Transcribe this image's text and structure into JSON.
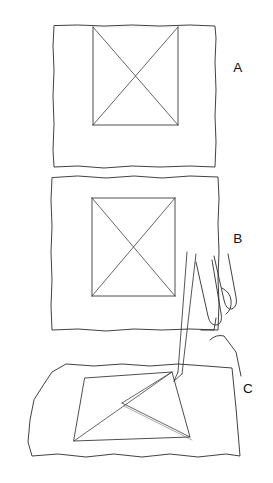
{
  "figure": {
    "background_color": "#ffffff",
    "ink_color": "#1a1a1a",
    "width": 273,
    "height": 483
  },
  "panels": [
    {
      "id": "panel-a",
      "label": "A",
      "label_x": 238,
      "label_y": 72,
      "description": "Flat sheet of paper, front view, containing an upright rectangle crossed by two full diagonals forming an X. The rectangle top edge is faint.",
      "sheet": {
        "name": "paper-sheet",
        "outline": "M 54,26 L 53,46 L 54,70 L 53,96 L 54,124 L 53,150 L 54,167 L 78,166 L 104,168 L 132,166 L 160,167 L 190,166 L 215,167 L 216,142 L 215,116 L 216,90 L 215,62 L 216,38 L 215,26 L 190,25 L 160,26 L 132,25 L 104,26 L 78,25 Z"
      },
      "inner_rect": {
        "name": "drawn-rectangle",
        "x1": 93,
        "y1": 27,
        "x2": 178,
        "y2": 125,
        "top_edge_visible": false
      },
      "diagonals": [
        {
          "name": "diagonal-tl-br",
          "x1": 93,
          "y1": 27,
          "x2": 178,
          "y2": 125
        },
        {
          "name": "diagonal-tr-bl",
          "x1": 178,
          "y1": 27,
          "x2": 93,
          "y2": 125
        }
      ]
    },
    {
      "id": "panel-b",
      "label": "B",
      "label_x": 238,
      "label_y": 243,
      "description": "Flat sheet of paper, front view, containing a complete upright rectangle crossed by two full diagonals forming an X. Finger tips of a hand appear at the lower right edge.",
      "sheet": {
        "name": "paper-sheet",
        "outline": "M 52,178 L 51,200 L 52,226 L 51,252 L 52,280 L 51,306 L 52,330 L 78,329 L 106,331 L 134,329 L 162,330 L 190,329 L 218,330 L 219,304 L 218,278 L 219,252 L 218,224 L 219,198 L 218,177 L 190,176 L 162,178 L 134,176 L 106,178 L 78,176 Z"
      },
      "inner_rect": {
        "name": "drawn-rectangle",
        "x1": 92,
        "y1": 198,
        "x2": 175,
        "y2": 296,
        "top_edge_visible": true
      },
      "diagonals": [
        {
          "name": "diagonal-tl-br",
          "x1": 92,
          "y1": 198,
          "x2": 175,
          "y2": 296
        },
        {
          "name": "diagonal-tr-bl",
          "x1": 175,
          "y1": 198,
          "x2": 92,
          "y2": 296
        }
      ]
    },
    {
      "id": "panel-c",
      "label": "C",
      "label_x": 248,
      "label_y": 393,
      "description": "Sheet of paper seen in perspective from above, containing a trapezoidal rectangle. A partially drawn chevron shape is being traced by a pen held in a hand; only one and a half diagonals are complete.",
      "sheet": {
        "name": "paper-sheet-perspective",
        "outline": "M 34,400 L 30,420 L 28,442 L 32,456 L 58,454 L 86,457 L 114,454 L 142,457 L 170,454 L 198,457 L 226,454 L 240,456 L 238,432 L 236,408 L 234,388 L 232,368 L 206,366 L 178,364 L 150,366 L 122,364 L 94,366 L 66,364 L 52,372 L 44,384 Z"
      },
      "inner_rect": {
        "name": "drawn-rectangle-perspective",
        "points": "85,378 172,372 190,437 74,441"
      },
      "partial_diagonals": [
        {
          "name": "diagonal-drawn-full",
          "x1": 172,
          "y1": 372,
          "x2": 74,
          "y2": 441
        },
        {
          "name": "diagonal-chevron-upper",
          "x1": 172,
          "y1": 372,
          "x2": 122,
          "y2": 403
        },
        {
          "name": "diagonal-chevron-lower",
          "x1": 122,
          "y1": 403,
          "x2": 190,
          "y2": 437
        }
      ],
      "hand": {
        "name": "hand-holding-pen",
        "fingers": [
          {
            "name": "finger-1",
            "path": "M 196,262 L 208,316 Q 210,326 217,325 Q 223,323 221,313 L 212,260"
          },
          {
            "name": "finger-2",
            "path": "M 214,256 L 224,300 Q 226,310 232,309 Q 238,306 236,297 L 228,254"
          },
          {
            "name": "finger-3",
            "path": "M 222,288 Q 230,292 231,300 Q 232,310 226,314"
          }
        ],
        "knuckle_path": "M 201,330 L 214,330 L 216,318",
        "back_of_hand_path": "M 210,340 Q 216,334 224,336 L 236,352 L 241,376"
      },
      "pen": {
        "name": "pen-stylus",
        "left_edge": "M 187,252 L 178,372",
        "right_edge": "M 196,254 L 182,374",
        "tip_left": "M 178,372 L 174,381",
        "tip_right": "M 182,374 L 174,381",
        "tip_x": 174,
        "tip_y": 381
      }
    }
  ]
}
